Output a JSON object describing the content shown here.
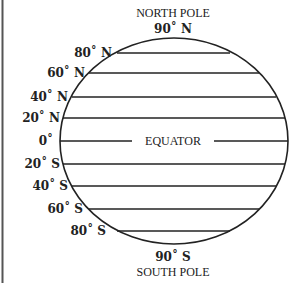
{
  "diagram": {
    "title_top": "NORTH POLE",
    "title_bottom": "SOUTH POLE",
    "equator_label": "EQUATOR",
    "north_pole_label": "90˚ N",
    "south_pole_label": "90˚ S",
    "latitudes": [
      {
        "label": "80˚ N",
        "y": 53
      },
      {
        "label": "60˚ N",
        "y": 73
      },
      {
        "label": "40˚ N",
        "y": 97
      },
      {
        "label": "20˚ N",
        "y": 118
      },
      {
        "label": "0˚",
        "y": 141
      },
      {
        "label": "20˚ S",
        "y": 164
      },
      {
        "label": "40˚ S",
        "y": 186
      },
      {
        "label": "60˚ S",
        "y": 209
      },
      {
        "label": "80˚ S",
        "y": 231
      }
    ],
    "colors": {
      "line": "#222222",
      "background": "#ffffff"
    }
  }
}
